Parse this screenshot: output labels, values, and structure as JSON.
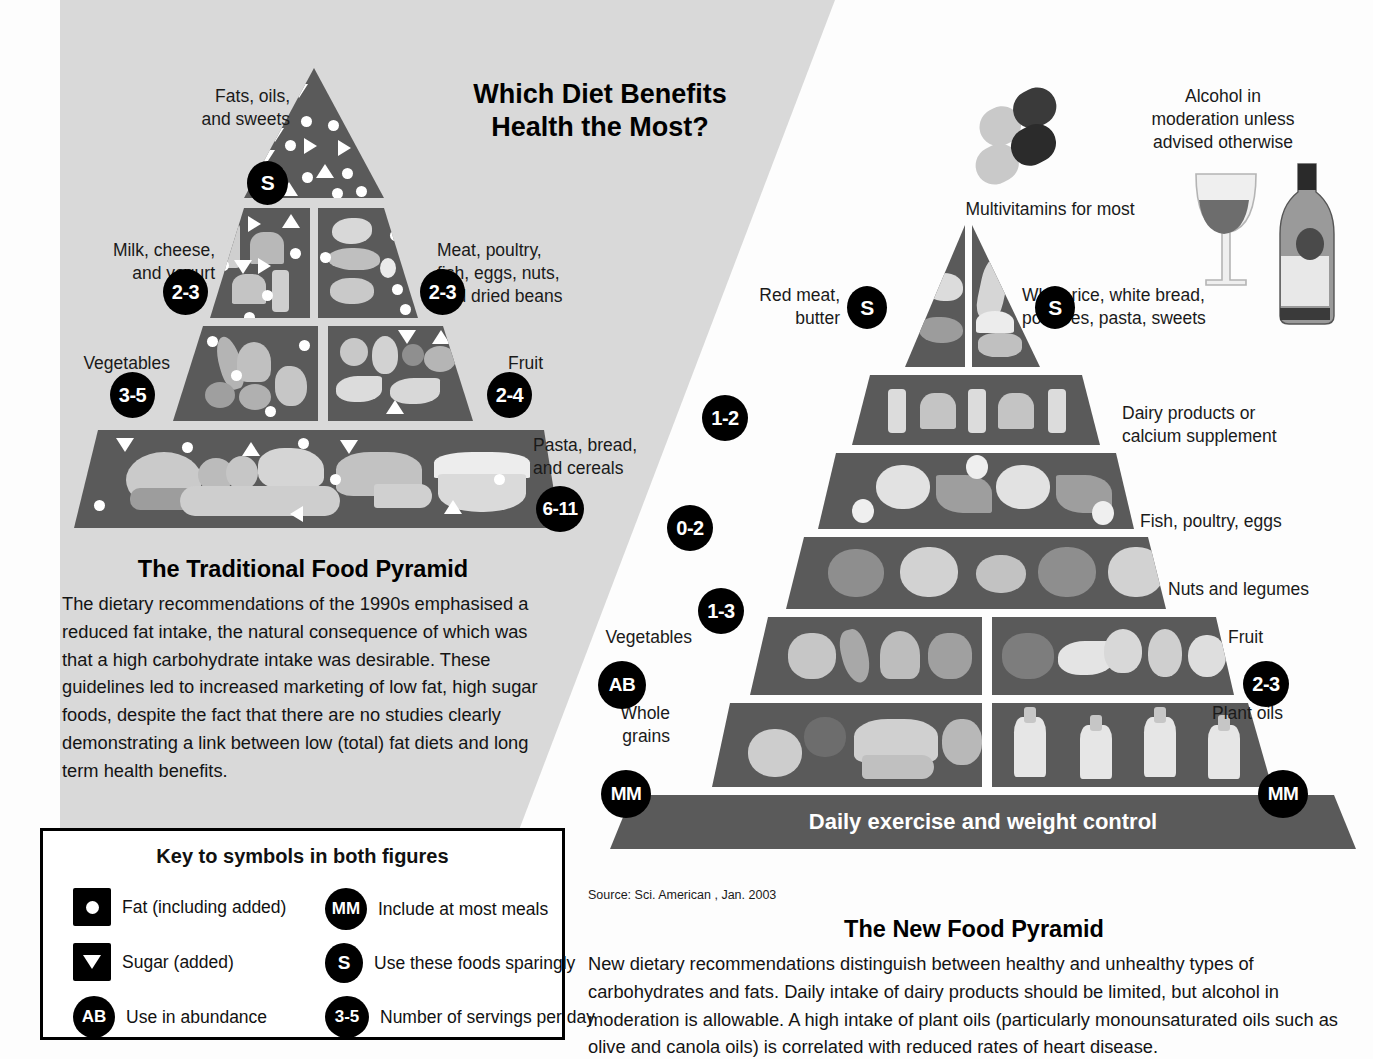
{
  "headline": "Which Diet Benefits\nHealth the Most?",
  "traditional": {
    "title": "The Traditional Food Pyramid",
    "body": "The dietary recommendations of the 1990s emphasised a reduced fat intake, the natural consequence of which was that a high carbohydrate intake was desirable. These guidelines led to increased marketing of low fat, high sugar foods, despite the fact that there are no studies clearly demonstrating a link between low (total) fat diets and long term health benefits.",
    "tiers": [
      {
        "label": "Fats, oils,\nand sweets",
        "badge": "S"
      },
      {
        "label": "Milk, cheese,\nand yogurt",
        "badge": "2-3"
      },
      {
        "label": "Meat, poultry,\nfish, eggs, nuts,\nand dried beans",
        "badge": "2-3"
      },
      {
        "label": "Vegetables",
        "badge": "3-5"
      },
      {
        "label": "Fruit",
        "badge": "2-4"
      },
      {
        "label": "Pasta, bread,\nand cereals",
        "badge": "6-11"
      }
    ]
  },
  "newpyramid": {
    "title": "The New Food Pyramid",
    "body": "New dietary recommendations distinguish between healthy and unhealthy types of carbohydrates and fats. Daily intake of dairy products should be limited, but alcohol in moderation is allowable. A high intake of plant oils (particularly monounsaturated oils such as olive and canola oils) is correlated with reduced rates of heart disease.",
    "source": "Source: Sci. American , Jan. 2003",
    "multivitamin_caption": "Multivitamins for most",
    "alcohol_caption": "Alcohol in\nmoderation unless\nadvised otherwise",
    "base_band": "Daily exercise and weight control",
    "tiers": [
      {
        "label": "Red meat,\nbutter",
        "badge": "S"
      },
      {
        "label": "White rice, white bread,\npotatoes, pasta, sweets",
        "badge": "S"
      },
      {
        "label": "Dairy products or\ncalcium supplement",
        "badge": "1-2"
      },
      {
        "label": "Fish, poultry, eggs",
        "badge": "0-2"
      },
      {
        "label": "Nuts and legumes",
        "badge": "1-3"
      },
      {
        "label": "Vegetables",
        "badge": "AB"
      },
      {
        "label": "Fruit",
        "badge": "2-3"
      },
      {
        "label": "Whole\ngrains",
        "badge": "MM"
      },
      {
        "label": "Plant oils",
        "badge": "MM"
      }
    ]
  },
  "key": {
    "title": "Key to symbols in both figures",
    "items": [
      {
        "symbol": "dot",
        "shape": "square",
        "label": "Fat (including added)"
      },
      {
        "symbol": "MM",
        "shape": "circle",
        "label": "Include at most meals"
      },
      {
        "symbol": "tri",
        "shape": "square",
        "label": "Sugar (added)"
      },
      {
        "symbol": "S",
        "shape": "circle",
        "label": "Use these foods sparingly"
      },
      {
        "symbol": "AB",
        "shape": "circle",
        "label": "Use in abundance"
      },
      {
        "symbol": "3-5",
        "shape": "circle",
        "label": "Number of servings per day"
      }
    ]
  },
  "colors": {
    "tier_fill": "#5a5a5a",
    "page_gray": "#d9d9d9",
    "badge": "#000000"
  }
}
